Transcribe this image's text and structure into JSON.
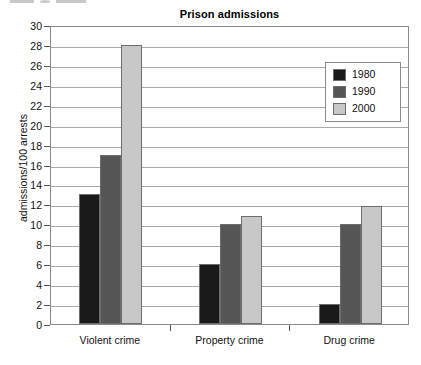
{
  "chart_data": {
    "type": "bar",
    "title": "Prison admissions",
    "xlabel": "",
    "ylabel": "admissions/100 arrests",
    "categories": [
      "Violent crime",
      "Property crime",
      "Drug crime"
    ],
    "series": [
      {
        "name": "1980",
        "color": "#1a1a1a",
        "values": [
          13,
          6,
          2
        ]
      },
      {
        "name": "1990",
        "color": "#565656",
        "values": [
          17,
          10,
          10
        ]
      },
      {
        "name": "2000",
        "color": "#c8c8c8",
        "values": [
          28,
          10.8,
          11.8
        ]
      }
    ],
    "ylim": [
      0,
      30
    ],
    "ytick_step": 2,
    "yticks": [
      0,
      2,
      4,
      6,
      8,
      10,
      12,
      14,
      16,
      18,
      20,
      22,
      24,
      26,
      28,
      30
    ],
    "grid": true,
    "legend_position": "top-right"
  },
  "legend": {
    "entries": [
      {
        "label": "1980",
        "color": "#1a1a1a"
      },
      {
        "label": "1990",
        "color": "#565656"
      },
      {
        "label": "2000",
        "color": "#c8c8c8"
      }
    ]
  }
}
